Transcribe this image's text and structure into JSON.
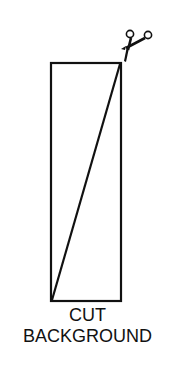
{
  "diagram": {
    "caption_line1": "CUT",
    "caption_line2": "BACKGROUND",
    "icon": "scissors-icon",
    "stroke_color": "#111111",
    "background_color": "#ffffff"
  }
}
